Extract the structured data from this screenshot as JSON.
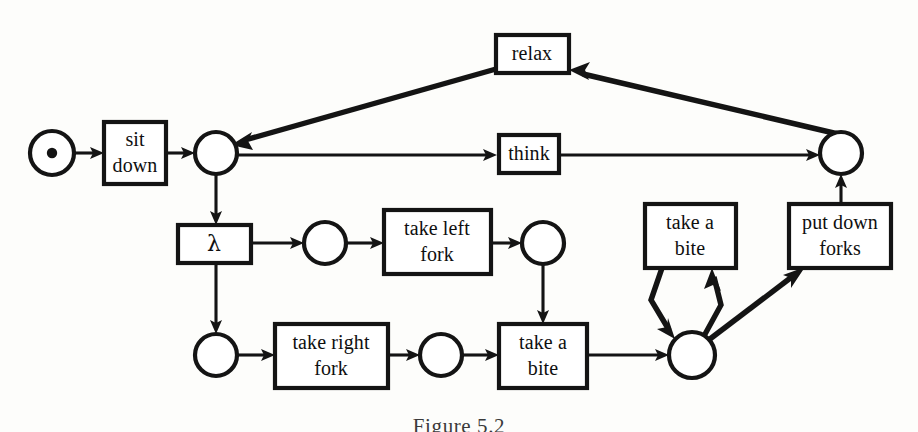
{
  "figure": {
    "caption": "Figure 5.2",
    "diagram_type": "petri-net",
    "colors": {
      "stroke": "#141414",
      "fill": "#ffffff",
      "background": "#fdfdfb"
    }
  },
  "transitions": [
    {
      "id": "sit-down",
      "label_line1": "sit",
      "label_line2": "down",
      "x": 104,
      "y": 122,
      "w": 62,
      "h": 62
    },
    {
      "id": "relax",
      "label_line1": "relax",
      "label_line2": "",
      "x": 496,
      "y": 35,
      "w": 73,
      "h": 38
    },
    {
      "id": "think",
      "label_line1": "think",
      "label_line2": "",
      "x": 499,
      "y": 135,
      "w": 60,
      "h": 38
    },
    {
      "id": "lambda",
      "label_line1": "λ",
      "label_line2": "",
      "x": 178,
      "y": 225,
      "w": 73,
      "h": 38
    },
    {
      "id": "take-left-fork",
      "label_line1": "take left",
      "label_line2": "fork",
      "x": 384,
      "y": 210,
      "w": 107,
      "h": 64
    },
    {
      "id": "take-right-fork",
      "label_line1": "take right",
      "label_line2": "fork",
      "x": 275,
      "y": 324,
      "w": 113,
      "h": 64
    },
    {
      "id": "take-a-bite-low",
      "label_line1": "take a",
      "label_line2": "bite",
      "x": 499,
      "y": 324,
      "w": 88,
      "h": 64
    },
    {
      "id": "take-a-bite-up",
      "label_line1": "take a",
      "label_line2": "bite",
      "x": 645,
      "y": 204,
      "w": 91,
      "h": 64
    },
    {
      "id": "put-down-forks",
      "label_line1": "put down",
      "label_line2": "forks",
      "x": 789,
      "y": 204,
      "w": 102,
      "h": 64
    }
  ],
  "places": [
    {
      "id": "place-start",
      "cx": 52,
      "cy": 153,
      "r": 22,
      "token": true
    },
    {
      "id": "place-seated",
      "cx": 216,
      "cy": 153,
      "r": 21,
      "token": false
    },
    {
      "id": "place-left-pre",
      "cx": 325,
      "cy": 243,
      "r": 21,
      "token": false
    },
    {
      "id": "place-left-post",
      "cx": 543,
      "cy": 243,
      "r": 21,
      "token": false
    },
    {
      "id": "place-right-pre",
      "cx": 216,
      "cy": 355,
      "r": 21,
      "token": false
    },
    {
      "id": "place-right-post",
      "cx": 441,
      "cy": 355,
      "r": 21,
      "token": false
    },
    {
      "id": "place-eating",
      "cx": 692,
      "cy": 355,
      "r": 23,
      "token": false
    },
    {
      "id": "place-done",
      "cx": 841,
      "cy": 153,
      "r": 21,
      "token": false
    }
  ],
  "arcs": [
    {
      "id": "arc-start-to-sitdown",
      "from": "place-start",
      "to": "sit-down"
    },
    {
      "id": "arc-sitdown-to-seated",
      "from": "sit-down",
      "to": "place-seated"
    },
    {
      "id": "arc-seated-to-think",
      "from": "place-seated",
      "to": "think"
    },
    {
      "id": "arc-think-to-done",
      "from": "think",
      "to": "place-done"
    },
    {
      "id": "arc-done-to-relax",
      "from": "place-done",
      "to": "relax"
    },
    {
      "id": "arc-relax-to-seated",
      "from": "relax",
      "to": "place-seated"
    },
    {
      "id": "arc-seated-to-lambda",
      "from": "place-seated",
      "to": "lambda"
    },
    {
      "id": "arc-lambda-to-leftpre",
      "from": "lambda",
      "to": "place-left-pre"
    },
    {
      "id": "arc-lambda-to-rightpre",
      "from": "lambda",
      "to": "place-right-pre"
    },
    {
      "id": "arc-leftpre-to-takeleft",
      "from": "place-left-pre",
      "to": "take-left-fork"
    },
    {
      "id": "arc-takeleft-to-leftpost",
      "from": "take-left-fork",
      "to": "place-left-post"
    },
    {
      "id": "arc-leftpost-to-bite",
      "from": "place-left-post",
      "to": "take-a-bite-low"
    },
    {
      "id": "arc-rightpre-to-takeright",
      "from": "place-right-pre",
      "to": "take-right-fork"
    },
    {
      "id": "arc-takeright-to-rightpost",
      "from": "take-right-fork",
      "to": "place-right-post"
    },
    {
      "id": "arc-rightpost-to-bite",
      "from": "place-right-post",
      "to": "take-a-bite-low"
    },
    {
      "id": "arc-bite-to-eating",
      "from": "take-a-bite-low",
      "to": "place-eating"
    },
    {
      "id": "arc-eating-to-biteup",
      "from": "place-eating",
      "to": "take-a-bite-up"
    },
    {
      "id": "arc-biteup-to-eating",
      "from": "take-a-bite-up",
      "to": "place-eating"
    },
    {
      "id": "arc-eating-to-putdown",
      "from": "place-eating",
      "to": "put-down-forks"
    },
    {
      "id": "arc-putdown-to-done",
      "from": "put-down-forks",
      "to": "place-done"
    }
  ]
}
